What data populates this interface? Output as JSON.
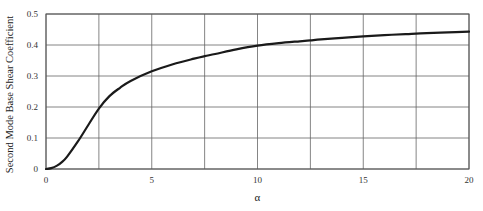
{
  "chart_data": {
    "type": "line",
    "title": "",
    "xlabel": "α",
    "ylabel": "Second Mode Base Shear Coefficient",
    "xlim": [
      0,
      20
    ],
    "ylim": [
      0,
      0.5
    ],
    "grid": true,
    "legend": null,
    "x_ticks": [
      0,
      5,
      10,
      15,
      20
    ],
    "x_tick_labels": [
      "0",
      "5",
      "10",
      "15",
      "20"
    ],
    "x_grid": [
      0,
      2.5,
      5,
      7.5,
      10,
      12.5,
      15,
      17.5,
      20
    ],
    "y_ticks": [
      0,
      0.1,
      0.2,
      0.3,
      0.4,
      0.5
    ],
    "y_tick_labels": [
      "0",
      "0.1",
      "0.2",
      "0.3",
      "0.4",
      "0.5"
    ],
    "series": [
      {
        "name": "Second mode base shear coefficient",
        "color": "#1a1a1a",
        "x": [
          0,
          0.25,
          0.5,
          0.75,
          1,
          1.5,
          2,
          2.5,
          3,
          3.5,
          4,
          5,
          6,
          7,
          7.5,
          8,
          9,
          10,
          11,
          12,
          12.5,
          13,
          14,
          15,
          16,
          17,
          17.5,
          18,
          19,
          20
        ],
        "y": [
          0,
          0.003,
          0.01,
          0.022,
          0.04,
          0.088,
          0.142,
          0.195,
          0.235,
          0.262,
          0.284,
          0.315,
          0.338,
          0.356,
          0.364,
          0.371,
          0.386,
          0.398,
          0.406,
          0.412,
          0.415,
          0.418,
          0.423,
          0.428,
          0.432,
          0.435,
          0.437,
          0.438,
          0.441,
          0.443
        ]
      }
    ]
  }
}
